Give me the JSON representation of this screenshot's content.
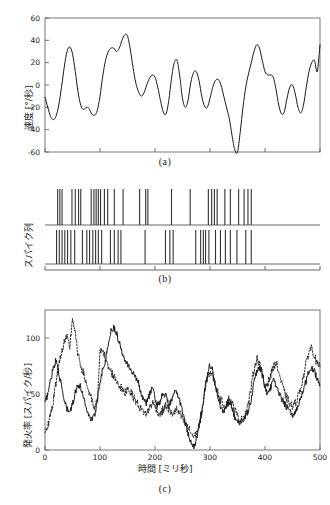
{
  "figure": {
    "title": "",
    "panels": [
      {
        "id": "a",
        "caption": "(a)"
      },
      {
        "id": "b",
        "caption": "(b)"
      },
      {
        "id": "c",
        "caption": "(c)"
      }
    ]
  },
  "panel_a": {
    "ylabel": "速度 [°/秒]",
    "yticks": [
      "60",
      "40",
      "20",
      "0",
      "-20",
      "-40",
      "-60"
    ]
  },
  "panel_b": {
    "ylabel": "スパイク列"
  },
  "panel_c": {
    "ylabel": "発火率 [スパイク/秒]",
    "xlabel": "時間 [ミリ秒]",
    "yticks": [
      "0",
      "50",
      "100"
    ],
    "xticks": [
      "0",
      "100",
      "200",
      "300",
      "400",
      "500"
    ]
  },
  "colors": {
    "line": "#1a1a1a",
    "axis": "#555555",
    "background": "#ffffff",
    "spike": "#333333"
  },
  "chart_data": [
    {
      "type": "line",
      "panel": "a",
      "title": "",
      "xlabel": "",
      "ylabel": "速度 [°/秒]",
      "xlim": [
        0,
        500
      ],
      "ylim": [
        -60,
        60
      ],
      "grid": false,
      "legend": "none",
      "yticks": [
        60,
        40,
        20,
        0,
        -20,
        -40,
        -60
      ],
      "x": [
        0,
        5,
        10,
        15,
        20,
        25,
        30,
        35,
        40,
        45,
        50,
        55,
        60,
        65,
        70,
        75,
        80,
        85,
        90,
        95,
        100,
        105,
        110,
        115,
        120,
        125,
        130,
        135,
        140,
        145,
        150,
        155,
        160,
        165,
        170,
        175,
        180,
        185,
        190,
        195,
        200,
        205,
        210,
        215,
        220,
        225,
        230,
        235,
        240,
        245,
        250,
        255,
        260,
        265,
        270,
        275,
        280,
        285,
        290,
        295,
        300,
        305,
        310,
        315,
        320,
        325,
        330,
        335,
        340,
        345,
        350,
        355,
        360,
        365,
        370,
        375,
        380,
        385,
        390,
        395,
        400,
        405,
        410,
        415,
        420,
        425,
        430,
        435,
        440,
        445,
        450,
        455,
        460,
        465,
        470,
        475,
        480,
        485,
        490,
        495,
        500
      ],
      "values": [
        -11,
        -20,
        -28,
        -31,
        -28,
        -18,
        -2,
        16,
        30,
        34,
        28,
        12,
        -6,
        -18,
        -22,
        -20,
        -21,
        -26,
        -27,
        -23,
        -10,
        8,
        22,
        30,
        33,
        33,
        30,
        33,
        40,
        45,
        44,
        32,
        16,
        2,
        -6,
        -10,
        -7,
        0,
        6,
        9,
        7,
        -2,
        -14,
        -24,
        -26,
        -14,
        6,
        20,
        22,
        8,
        -12,
        -20,
        -14,
        2,
        11,
        12,
        4,
        -10,
        -19,
        -20,
        -12,
        -2,
        4,
        5,
        0,
        -10,
        -20,
        -30,
        -45,
        -58,
        -60,
        -42,
        -20,
        -2,
        10,
        20,
        30,
        36,
        33,
        22,
        12,
        9,
        9,
        7,
        -4,
        -18,
        -26,
        -24,
        -12,
        -2,
        0,
        -8,
        -20,
        -25,
        -18,
        -2,
        12,
        20,
        22,
        12,
        36
      ],
      "series_style": "solid"
    },
    {
      "type": "raster",
      "panel": "b",
      "title": "",
      "ylabel": "スパイク列",
      "xlim": [
        0,
        500
      ],
      "grid": false,
      "legend": "none",
      "trains": [
        {
          "name": "train-1",
          "spike_times": [
            23,
            27,
            31,
            49,
            55,
            61,
            65,
            84,
            89,
            93,
            97,
            101,
            108,
            114,
            126,
            142,
            172,
            183,
            187,
            230,
            264,
            297,
            303,
            308,
            313,
            327,
            337,
            352,
            362,
            369,
            375
          ]
        },
        {
          "name": "train-2",
          "spike_times": [
            21,
            26,
            31,
            36,
            41,
            47,
            54,
            68,
            76,
            81,
            87,
            92,
            97,
            103,
            119,
            126,
            133,
            138,
            182,
            219,
            227,
            233,
            274,
            283,
            288,
            292,
            298,
            310,
            319,
            328,
            337,
            349,
            365,
            375
          ]
        }
      ]
    },
    {
      "type": "line",
      "panel": "c",
      "title": "",
      "xlabel": "時間 [ミリ秒]",
      "ylabel": "発火率 [スパイク/秒]",
      "xlim": [
        0,
        500
      ],
      "ylim": [
        0,
        125
      ],
      "grid": false,
      "legend": "none",
      "xticks": [
        0,
        100,
        200,
        300,
        400,
        500
      ],
      "yticks": [
        0,
        50,
        100
      ],
      "x": [
        0,
        5,
        10,
        15,
        20,
        25,
        30,
        35,
        40,
        45,
        50,
        55,
        60,
        65,
        70,
        75,
        80,
        85,
        90,
        95,
        100,
        105,
        110,
        115,
        120,
        125,
        130,
        135,
        140,
        145,
        150,
        155,
        160,
        165,
        170,
        175,
        180,
        185,
        190,
        195,
        200,
        205,
        210,
        215,
        220,
        225,
        230,
        235,
        240,
        245,
        250,
        255,
        260,
        265,
        270,
        275,
        280,
        285,
        290,
        295,
        300,
        305,
        310,
        315,
        320,
        325,
        330,
        335,
        340,
        345,
        350,
        355,
        360,
        365,
        370,
        375,
        380,
        385,
        390,
        395,
        400,
        405,
        410,
        415,
        420,
        425,
        430,
        435,
        440,
        445,
        450,
        455,
        460,
        465,
        470,
        475,
        480,
        485,
        490,
        495,
        500
      ],
      "series": [
        {
          "name": "solid-trace",
          "style": "solid",
          "values": [
            42,
            50,
            62,
            74,
            80,
            70,
            56,
            44,
            36,
            34,
            40,
            52,
            58,
            56,
            48,
            38,
            30,
            28,
            30,
            44,
            62,
            72,
            80,
            95,
            106,
            110,
            104,
            96,
            88,
            82,
            78,
            72,
            68,
            66,
            60,
            50,
            44,
            42,
            50,
            56,
            46,
            40,
            44,
            52,
            48,
            40,
            44,
            50,
            52,
            44,
            34,
            24,
            14,
            6,
            3,
            8,
            20,
            34,
            52,
            68,
            76,
            70,
            58,
            46,
            36,
            34,
            40,
            44,
            38,
            30,
            26,
            24,
            26,
            30,
            36,
            46,
            60,
            70,
            74,
            68,
            56,
            50,
            56,
            62,
            58,
            50,
            46,
            42,
            38,
            34,
            30,
            34,
            40,
            46,
            54,
            62,
            70,
            74,
            70,
            64,
            58
          ]
        },
        {
          "name": "dashed-trace",
          "style": "dashed",
          "values": [
            17,
            22,
            30,
            44,
            60,
            76,
            88,
            96,
            100,
            92,
            118,
            104,
            84,
            76,
            68,
            60,
            52,
            44,
            36,
            44,
            86,
            92,
            80,
            74,
            70,
            66,
            62,
            58,
            54,
            50,
            56,
            52,
            48,
            44,
            40,
            36,
            34,
            32,
            38,
            42,
            40,
            34,
            32,
            36,
            40,
            36,
            32,
            34,
            36,
            32,
            28,
            24,
            20,
            16,
            12,
            14,
            22,
            34,
            50,
            64,
            70,
            66,
            58,
            50,
            44,
            40,
            42,
            46,
            42,
            36,
            30,
            26,
            28,
            34,
            42,
            56,
            72,
            82,
            78,
            66,
            58,
            60,
            66,
            74,
            78,
            70,
            60,
            52,
            46,
            42,
            38,
            42,
            48,
            56,
            66,
            78,
            88,
            92,
            84,
            76,
            74
          ]
        }
      ]
    }
  ]
}
